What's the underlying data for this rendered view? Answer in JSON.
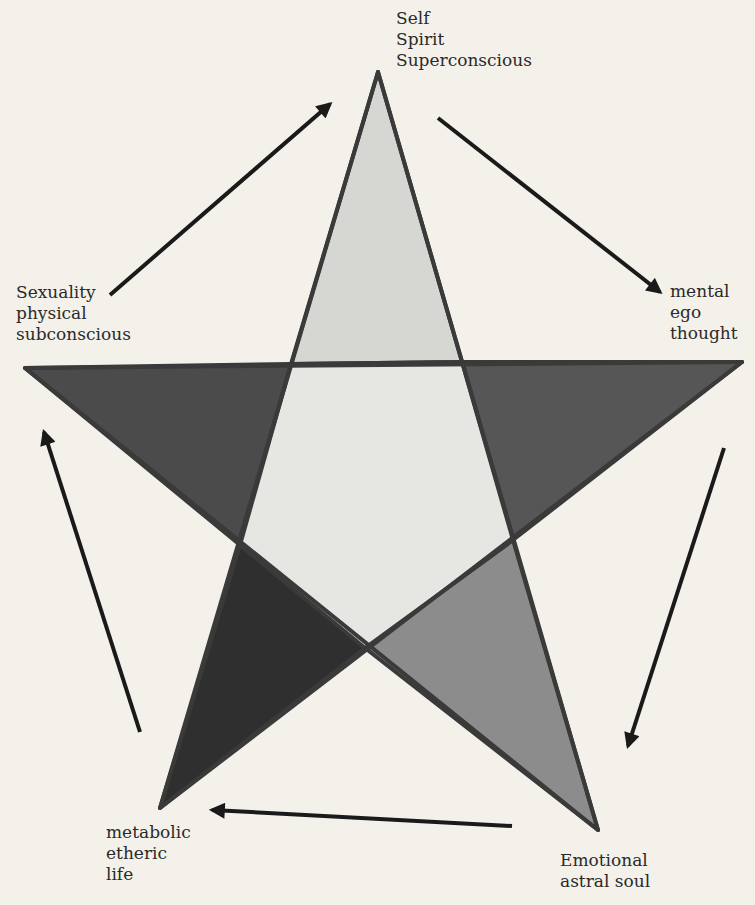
{
  "diagram": {
    "type": "pentagram-cycle",
    "colors": {
      "background": "#f3f1ea",
      "outline": "#3a3a3a",
      "top_point": "#d4d4d0",
      "center_pentagon": "#e4e4e0",
      "left_point": "#4a4a4a",
      "right_point": "#555555",
      "bottom_left_point": "#2e2e2e",
      "bottom_right_point": "#8a8a8a",
      "arrow": "#1a1a1a"
    },
    "nodes": {
      "top": {
        "lines": [
          "Self",
          "Spirit",
          "Superconscious"
        ]
      },
      "right": {
        "lines": [
          "mental",
          "ego",
          "thought"
        ]
      },
      "bottom_right": {
        "lines": [
          "Emotional",
          "astral soul"
        ]
      },
      "bottom_left": {
        "lines": [
          "metabolic",
          "etheric",
          "life"
        ]
      },
      "left": {
        "lines": [
          "Sexuality",
          "physical",
          "subconscious"
        ]
      }
    },
    "cycle_order": [
      "left",
      "top",
      "right",
      "bottom_right",
      "bottom_left",
      "left"
    ]
  }
}
